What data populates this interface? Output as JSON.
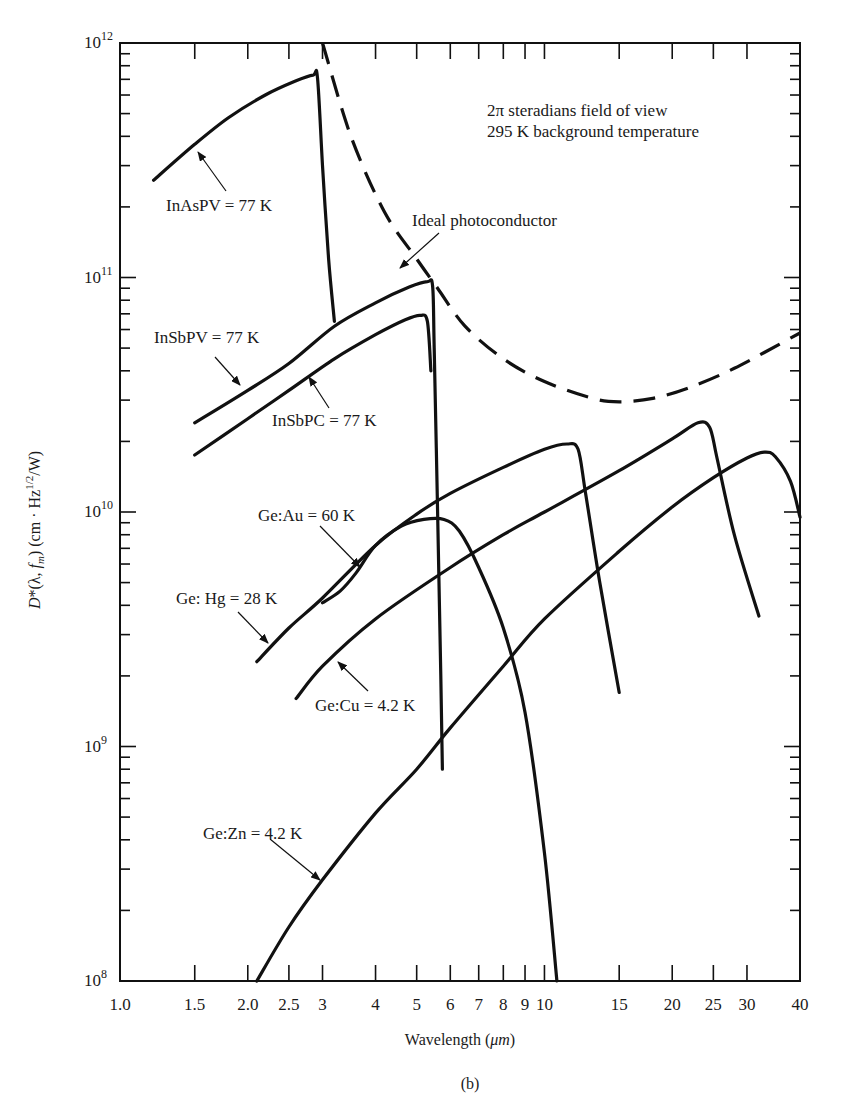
{
  "figure": {
    "caption": "(b)",
    "annotation_line1": "2π steradians field of view",
    "annotation_line2": "295 K background temperature"
  },
  "chart_data": {
    "type": "line",
    "title": "",
    "xlabel": "Wavelength (μm)",
    "ylabel": "D*(λ, f_m) (cm · Hz^1/2/W)",
    "xscale": "log",
    "yscale": "log",
    "xlim": [
      1.0,
      40
    ],
    "ylim": [
      100000000.0,
      1000000000000.0
    ],
    "grid": false,
    "legend_position": "inline labels with arrows",
    "x_ticks": [
      1.0,
      1.5,
      2.0,
      2.5,
      3,
      4,
      5,
      6,
      7,
      8,
      9,
      10,
      15,
      20,
      25,
      30,
      40
    ],
    "x_tick_labels": [
      "1.0",
      "1.5",
      "2.0",
      "2.5",
      "3",
      "4",
      "5",
      "6",
      "7",
      "8",
      "9",
      "10",
      "15",
      "20",
      "25",
      "30",
      "40"
    ],
    "y_ticks": [
      100000000.0,
      1000000000.0,
      10000000000.0,
      100000000000.0,
      1000000000000.0
    ],
    "y_tick_labels": [
      "10^8",
      "10^9",
      "10^10",
      "10^11",
      "10^12"
    ],
    "series": [
      {
        "name": "Ideal photoconductor",
        "style": "dashed",
        "points": [
          [
            3.0,
            1000000000000.0
          ],
          [
            3.5,
            400000000000.0
          ],
          [
            4.2,
            190000000000.0
          ],
          [
            5.0,
            120000000000.0
          ],
          [
            5.6,
            90000000000.0
          ],
          [
            6.5,
            62000000000.0
          ],
          [
            8.0,
            45000000000.0
          ],
          [
            10,
            36000000000.0
          ],
          [
            13,
            30500000000.0
          ],
          [
            15,
            29500000000.0
          ],
          [
            18,
            30500000000.0
          ],
          [
            22,
            34000000000.0
          ],
          [
            28,
            41000000000.0
          ],
          [
            40,
            58000000000.0
          ]
        ]
      },
      {
        "name": "InAsPV = 77 K",
        "style": "solid",
        "points": [
          [
            1.2,
            260000000000.0
          ],
          [
            1.5,
            370000000000.0
          ],
          [
            1.8,
            480000000000.0
          ],
          [
            2.2,
            600000000000.0
          ],
          [
            2.6,
            690000000000.0
          ],
          [
            2.85,
            730000000000.0
          ],
          [
            2.92,
            710000000000.0
          ],
          [
            3.0,
            300000000000.0
          ],
          [
            3.1,
            120000000000.0
          ],
          [
            3.2,
            65000000000.0
          ]
        ]
      },
      {
        "name": "InSbPV = 77 K",
        "style": "solid",
        "points": [
          [
            1.5,
            24000000000.0
          ],
          [
            2.0,
            33000000000.0
          ],
          [
            2.5,
            43000000000.0
          ],
          [
            3.2,
            62000000000.0
          ],
          [
            4.0,
            78000000000.0
          ],
          [
            4.8,
            91000000000.0
          ],
          [
            5.3,
            96000000000.0
          ],
          [
            5.45,
            92000000000.0
          ],
          [
            5.5,
            50000000000.0
          ],
          [
            5.6,
            10000000000.0
          ],
          [
            5.7,
            2000000000.0
          ],
          [
            5.75,
            800000000.0
          ]
        ]
      },
      {
        "name": "InSbPC = 77 K",
        "style": "solid",
        "points": [
          [
            1.5,
            17500000000.0
          ],
          [
            2.0,
            25000000000.0
          ],
          [
            2.5,
            33000000000.0
          ],
          [
            3.2,
            45000000000.0
          ],
          [
            4.0,
            57000000000.0
          ],
          [
            4.7,
            66000000000.0
          ],
          [
            5.1,
            69000000000.0
          ],
          [
            5.3,
            65000000000.0
          ],
          [
            5.4,
            40000000000.0
          ]
        ]
      },
      {
        "name": "Ge:Au = 60 K",
        "style": "solid",
        "points": [
          [
            3.0,
            4100000000.0
          ],
          [
            3.3,
            4600000000.0
          ],
          [
            3.6,
            5500000000.0
          ],
          [
            4.0,
            7200000000.0
          ],
          [
            4.6,
            8700000000.0
          ],
          [
            5.2,
            9300000000.0
          ],
          [
            5.8,
            9300000000.0
          ],
          [
            6.3,
            8300000000.0
          ],
          [
            7.0,
            5800000000.0
          ],
          [
            8.0,
            3200000000.0
          ],
          [
            9.0,
            1400000000.0
          ],
          [
            10.0,
            350000000.0
          ],
          [
            10.7,
            100000000.0
          ]
        ]
      },
      {
        "name": "Ge: Hg = 28 K",
        "style": "solid",
        "points": [
          [
            2.1,
            2300000000.0
          ],
          [
            2.5,
            3200000000.0
          ],
          [
            3.0,
            4300000000.0
          ],
          [
            4.0,
            7200000000.0
          ],
          [
            5.0,
            9800000000.0
          ],
          [
            6.0,
            12000000000.0
          ],
          [
            8.0,
            15500000000.0
          ],
          [
            10.0,
            18500000000.0
          ],
          [
            11.3,
            19500000000.0
          ],
          [
            12.0,
            18500000000.0
          ],
          [
            12.5,
            12000000000.0
          ],
          [
            13.5,
            5000000000.0
          ],
          [
            15.0,
            1700000000.0
          ]
        ]
      },
      {
        "name": "Ge:Cu = 4.2 K",
        "style": "solid",
        "points": [
          [
            2.6,
            1600000000.0
          ],
          [
            3.0,
            2200000000.0
          ],
          [
            4.0,
            3500000000.0
          ],
          [
            6.0,
            5800000000.0
          ],
          [
            8.0,
            8000000000.0
          ],
          [
            10,
            10000000000.0
          ],
          [
            15,
            15000000000.0
          ],
          [
            20,
            20500000000.0
          ],
          [
            23,
            24000000000.0
          ],
          [
            24.5,
            23000000000.0
          ],
          [
            25.5,
            17000000000.0
          ],
          [
            28,
            8000000000.0
          ],
          [
            32,
            3600000000.0
          ]
        ]
      },
      {
        "name": "Ge:Zn = 4.2 K",
        "style": "solid",
        "points": [
          [
            2.1,
            100000000.0
          ],
          [
            2.5,
            170000000.0
          ],
          [
            3.0,
            270000000.0
          ],
          [
            4.0,
            520000000.0
          ],
          [
            5.0,
            800000000.0
          ],
          [
            6.0,
            1200000000.0
          ],
          [
            8.0,
            2200000000.0
          ],
          [
            10.0,
            3500000000.0
          ],
          [
            15,
            6800000000.0
          ],
          [
            20,
            10500000000.0
          ],
          [
            25,
            14000000000.0
          ],
          [
            30,
            17000000000.0
          ],
          [
            33,
            18000000000.0
          ],
          [
            35,
            17200000000.0
          ],
          [
            38,
            13500000000.0
          ],
          [
            40,
            9500000000.0
          ]
        ]
      }
    ]
  },
  "labels": {
    "ideal": "Ideal photoconductor",
    "inas_pv": "InAsPV = 77 K",
    "insb_pv": "InSbPV = 77 K",
    "insb_pc": "InSbPC = 77 K",
    "ge_au": "Ge:Au = 60 K",
    "ge_hg": "Ge: Hg = 28 K",
    "ge_cu": "Ge:Cu = 4.2 K",
    "ge_zn": "Ge:Zn = 4.2 K"
  },
  "axes": {
    "xlabel_prefix": "Wavelength (",
    "xlabel_unit": "μm",
    "xlabel_suffix": ")",
    "ylabel_D": "D",
    "ylabel_mid": "*(λ, ",
    "ylabel_f": "f",
    "ylabel_m": "m",
    "ylabel_units": ") (cm · Hz",
    "ylabel_exp": "1/2",
    "ylabel_end": "/W)",
    "y_base": "10",
    "y_exps": [
      "12",
      "11",
      "10",
      "9",
      "8"
    ]
  }
}
